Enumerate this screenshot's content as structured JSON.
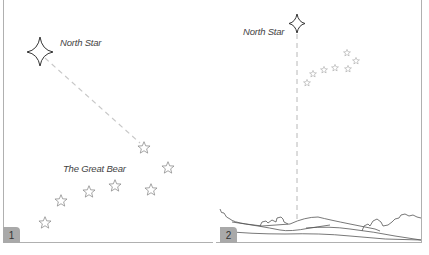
{
  "panels": [
    {
      "number": "1",
      "north_star_label": "North Star",
      "constellation_label": "The Great Bear"
    },
    {
      "number": "2",
      "north_star_label": "North Star"
    }
  ],
  "colors": {
    "border": "#b0b0b0",
    "star_outline": "#8a8a8a",
    "north_star_outline": "#333333",
    "dashed_line": "#c8c8c8",
    "badge_bg": "#a9a9a9",
    "landscape": "#555555"
  }
}
